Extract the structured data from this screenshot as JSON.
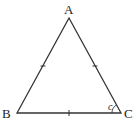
{
  "diagram": {
    "type": "equilateral-triangle",
    "vertices": {
      "A": {
        "label": "A",
        "x": 69,
        "y": 18
      },
      "B": {
        "label": "B",
        "x": 17,
        "y": 113
      },
      "C": {
        "label": "C",
        "x": 121,
        "y": 113
      }
    },
    "angle_label": "c",
    "tick_marks": [
      "AB",
      "AC",
      "BC"
    ],
    "stroke_color": "#333333"
  }
}
